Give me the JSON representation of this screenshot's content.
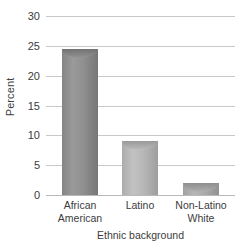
{
  "chart_data": {
    "type": "bar",
    "title": "",
    "xlabel": "Ethnic background",
    "ylabel": "Percent",
    "categories": [
      "African\nAmerican",
      "Latino",
      "Non-Latino\nWhite"
    ],
    "category_lines": [
      [
        "African",
        "American"
      ],
      [
        "Latino"
      ],
      [
        "Non-Latino",
        "White"
      ]
    ],
    "values": [
      24.5,
      9,
      2
    ],
    "ylim": [
      0,
      30
    ],
    "yticks": [
      0,
      5,
      10,
      15,
      20,
      25,
      30
    ],
    "ytick_labels": [
      "0",
      "5",
      "10",
      "15",
      "20",
      "25",
      "30"
    ],
    "grid": true,
    "legend": "none",
    "bar_style": "cylinder-3d",
    "colors": {
      "bar_african_american": "#8c8c8c",
      "bar_latino": "#b4b4b4",
      "bar_non_latino_white": "#a8a8a8",
      "gridline": "#c9c9c9",
      "text": "#3c3c3c",
      "background": "#ffffff"
    }
  }
}
